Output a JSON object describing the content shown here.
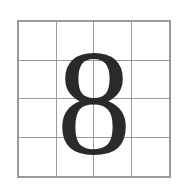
{
  "character": "8",
  "grid": {
    "rows": 4,
    "columns": 4,
    "line_color": "#9a9a9a"
  },
  "glyph_color": "#2a2a2a"
}
